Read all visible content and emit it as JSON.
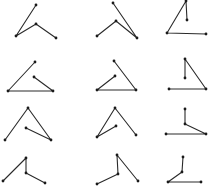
{
  "figure": {
    "rows": 4,
    "cols": 3,
    "stroke_color": "#2a2a2a",
    "vertex_color": "#1a1a1a",
    "background": "#ffffff"
  },
  "figures": [
    {
      "id": "r1c1",
      "points": [
        [
          36,
          5
        ],
        [
          16,
          36
        ],
        [
          36,
          24
        ],
        [
          56,
          38
        ]
      ]
    },
    {
      "id": "r1c2",
      "points": [
        [
          113,
          3
        ],
        [
          137,
          38
        ],
        [
          116,
          21
        ],
        [
          97,
          36
        ]
      ]
    },
    {
      "id": "r1c3",
      "points": [
        [
          187,
          20
        ],
        [
          186,
          1
        ],
        [
          167,
          33
        ],
        [
          206,
          34
        ]
      ]
    },
    {
      "id": "r2c1",
      "points": [
        [
          35,
          62
        ],
        [
          8,
          91
        ],
        [
          53,
          91
        ],
        [
          34,
          77
        ]
      ]
    },
    {
      "id": "r2c2",
      "points": [
        [
          114,
          61
        ],
        [
          136,
          90
        ],
        [
          97,
          90
        ],
        [
          115,
          76
        ]
      ]
    },
    {
      "id": "r2c3",
      "points": [
        [
          185,
          78
        ],
        [
          185,
          59
        ],
        [
          206,
          89
        ],
        [
          169,
          89
        ]
      ]
    },
    {
      "id": "r3c1",
      "points": [
        [
          5,
          140
        ],
        [
          28,
          108
        ],
        [
          51,
          140
        ],
        [
          26,
          128
        ]
      ]
    },
    {
      "id": "r3c2",
      "points": [
        [
          116,
          126
        ],
        [
          97,
          137
        ],
        [
          115,
          108
        ],
        [
          136,
          135
        ]
      ]
    },
    {
      "id": "r3c3",
      "points": [
        [
          185,
          109
        ],
        [
          185,
          124
        ],
        [
          206,
          134
        ],
        [
          166,
          134
        ]
      ]
    },
    {
      "id": "r4c1",
      "points": [
        [
          3,
          181
        ],
        [
          26,
          158
        ],
        [
          26,
          173
        ],
        [
          45,
          183
        ]
      ]
    },
    {
      "id": "r4c2",
      "points": [
        [
          97,
          184
        ],
        [
          118,
          174
        ],
        [
          117,
          155
        ],
        [
          138,
          181
        ]
      ]
    },
    {
      "id": "r4c3",
      "points": [
        [
          183,
          157
        ],
        [
          182,
          172
        ],
        [
          168,
          182
        ],
        [
          201,
          182
        ]
      ]
    }
  ]
}
